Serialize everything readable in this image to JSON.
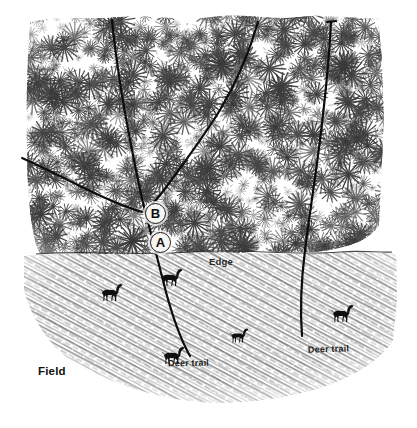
{
  "figure": {
    "style": "pen-and-ink hand drawing, black on white"
  },
  "labels": {
    "field": "Field",
    "edge": "Edge",
    "deer_trail_left": "Deer trail",
    "deer_trail_right": "Deer trail",
    "point_a": "A",
    "point_b": "B"
  },
  "regions": [
    {
      "name": "woods",
      "label": "",
      "bounds": [
        26,
        16,
        376,
        238
      ],
      "fill": "#ffffff",
      "texture": "coniferous-brush-hatching"
    },
    {
      "name": "field",
      "label": "Field",
      "bounds": [
        22,
        252,
        395,
        405
      ],
      "fill": "#ffffff",
      "texture": "diagonal-grass-hatching"
    },
    {
      "name": "edge",
      "label": "Edge",
      "y": 253,
      "description": "boundary line between woods and field"
    }
  ],
  "trails": [
    {
      "name": "trail-left-main",
      "label": "Deer trail",
      "enters": "woods-top",
      "exits": "field-bottom"
    },
    {
      "name": "trail-branch-west",
      "label": "",
      "enters": "woods-left",
      "joins": "trail-left-main at B"
    },
    {
      "name": "trail-middle",
      "label": "",
      "enters": "woods-top",
      "joins": "trail-left-main at B"
    },
    {
      "name": "trail-right",
      "label": "Deer trail",
      "enters": "woods-top",
      "exits": "field"
    }
  ],
  "deer": [
    {
      "name": "deer-1",
      "x": 110,
      "y": 293,
      "facing": "left"
    },
    {
      "name": "deer-2",
      "x": 170,
      "y": 278,
      "facing": "left"
    },
    {
      "name": "deer-3",
      "x": 238,
      "y": 336,
      "facing": "left"
    },
    {
      "name": "deer-4",
      "x": 172,
      "y": 356,
      "facing": "left"
    },
    {
      "name": "deer-5",
      "x": 341,
      "y": 314,
      "facing": "left"
    }
  ],
  "colors": {
    "ink": "#1a1a1a",
    "paper": "#ffffff",
    "woods_tone": "#5a5a5a",
    "field_tone": "#7a7a7a"
  }
}
